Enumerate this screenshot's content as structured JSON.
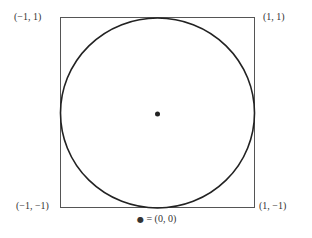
{
  "diagram": {
    "corners": {
      "top_left": "(−1, 1)",
      "top_right": "(1, 1)",
      "bottom_left": "(−1, −1)",
      "bottom_right": "(1, −1)"
    },
    "legend": {
      "symbol": "●",
      "text": "= (0, 0)"
    },
    "colors": {
      "square_stroke": "#555555",
      "circle_stroke": "#222222",
      "center_dot": "#222222"
    }
  }
}
